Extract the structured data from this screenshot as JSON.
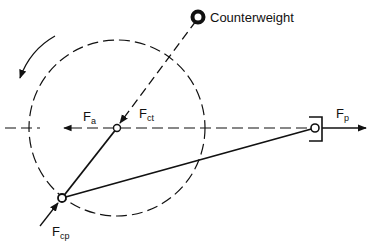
{
  "labels": {
    "counterweight": "Counterweight",
    "fa": {
      "main": "F",
      "sub": "a"
    },
    "fct": {
      "main": "F",
      "sub": "ct"
    },
    "fp": {
      "main": "F",
      "sub": "p"
    },
    "fcp": {
      "main": "F",
      "sub": "cp"
    }
  },
  "colors": {
    "stroke": "#111111",
    "background": "#ffffff"
  },
  "rotation_direction": "counterclockwise"
}
